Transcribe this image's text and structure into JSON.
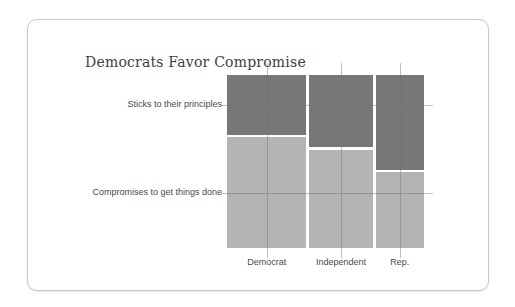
{
  "chart_data": {
    "type": "mosaic",
    "title": "Democrats Favor Compromise",
    "x_categories": [
      "Democrat",
      "Independent",
      "Rep."
    ],
    "y_categories": [
      "Sticks to their principles",
      "Compromises to get things done"
    ],
    "column_width_pct": [
      41.6,
      33.1,
      25.3
    ],
    "series": [
      {
        "name": "Sticks to their principles",
        "values_pct": [
          35.0,
          42.5,
          55.5
        ]
      },
      {
        "name": "Compromises to get things done",
        "values_pct": [
          65.0,
          57.5,
          44.5
        ]
      }
    ],
    "legend": "none",
    "grid": "category reference lines with outer ticks",
    "colors": {
      "sticks": "#777777",
      "compromises": "#b4b4b4",
      "gridline": "rgba(110,110,110,0.45)",
      "label_text": "#4a4a4a",
      "title_text": "#3d4043",
      "card_border": "#c9c9c9",
      "card_background": "#ffffff"
    }
  }
}
